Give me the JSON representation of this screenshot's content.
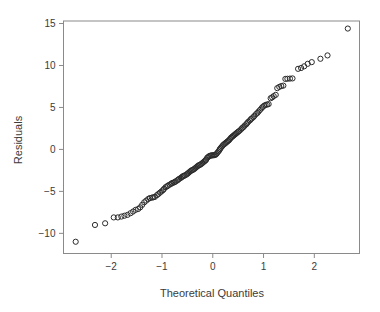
{
  "chart_data": {
    "type": "scatter",
    "title": "",
    "xlabel": "Theoretical Quantiles",
    "ylabel": "Residuals",
    "xlim": [
      -2.94,
      2.89
    ],
    "ylim": [
      -12.4,
      15.3
    ],
    "xticks": [
      -2,
      -1,
      0,
      1,
      2
    ],
    "xtick_labels": [
      "−2",
      "−1",
      "0",
      "1",
      "2"
    ],
    "yticks": [
      -10,
      -5,
      0,
      5,
      10,
      15
    ],
    "ytick_labels": [
      "−10",
      "−5",
      "0",
      "5",
      "10",
      "15"
    ],
    "grid": false,
    "legend": null,
    "marker": "open-circle",
    "marker_color": "#2b2b2b",
    "marker_radius": 2.6,
    "box_color": "#8a8a8a",
    "points": [
      [
        -2.7,
        -11.0
      ],
      [
        -2.32,
        -9.0
      ],
      [
        -2.12,
        -8.8
      ],
      [
        -1.95,
        -8.1
      ],
      [
        -1.87,
        -8.1
      ],
      [
        -1.8,
        -8.0
      ],
      [
        -1.74,
        -7.9
      ],
      [
        -1.68,
        -7.8
      ],
      [
        -1.62,
        -7.6
      ],
      [
        -1.57,
        -7.4
      ],
      [
        -1.52,
        -7.2
      ],
      [
        -1.47,
        -7.1
      ],
      [
        -1.43,
        -6.9
      ],
      [
        -1.39,
        -6.6
      ],
      [
        -1.35,
        -6.3
      ],
      [
        -1.31,
        -6.1
      ],
      [
        -1.27,
        -5.9
      ],
      [
        -1.24,
        -5.8
      ],
      [
        -1.2,
        -5.75
      ],
      [
        -1.17,
        -5.7
      ],
      [
        -1.14,
        -5.65
      ],
      [
        -1.1,
        -5.45
      ],
      [
        -1.07,
        -5.3
      ],
      [
        -1.04,
        -5.15
      ],
      [
        -1.01,
        -5.0
      ],
      [
        -0.98,
        -4.85
      ],
      [
        -0.96,
        -4.7
      ],
      [
        -0.93,
        -4.5
      ],
      [
        -0.9,
        -4.4
      ],
      [
        -0.88,
        -4.3
      ],
      [
        -0.85,
        -4.2
      ],
      [
        -0.82,
        -4.1
      ],
      [
        -0.8,
        -4.0
      ],
      [
        -0.77,
        -3.95
      ],
      [
        -0.75,
        -3.9
      ],
      [
        -0.73,
        -3.8
      ],
      [
        -0.7,
        -3.7
      ],
      [
        -0.68,
        -3.6
      ],
      [
        -0.66,
        -3.5
      ],
      [
        -0.63,
        -3.4
      ],
      [
        -0.61,
        -3.3
      ],
      [
        -0.59,
        -3.2
      ],
      [
        -0.57,
        -3.15
      ],
      [
        -0.55,
        -3.1
      ],
      [
        -0.52,
        -3.0
      ],
      [
        -0.5,
        -2.9
      ],
      [
        -0.48,
        -2.8
      ],
      [
        -0.46,
        -2.7
      ],
      [
        -0.44,
        -2.6
      ],
      [
        -0.42,
        -2.5
      ],
      [
        -0.4,
        -2.45
      ],
      [
        -0.38,
        -2.4
      ],
      [
        -0.36,
        -2.3
      ],
      [
        -0.34,
        -2.2
      ],
      [
        -0.32,
        -2.1
      ],
      [
        -0.3,
        -2.0
      ],
      [
        -0.28,
        -1.9
      ],
      [
        -0.26,
        -1.85
      ],
      [
        -0.24,
        -1.8
      ],
      [
        -0.22,
        -1.7
      ],
      [
        -0.2,
        -1.6
      ],
      [
        -0.18,
        -1.5
      ],
      [
        -0.16,
        -1.4
      ],
      [
        -0.14,
        -1.3
      ],
      [
        -0.13,
        -1.2
      ],
      [
        -0.11,
        -1.0
      ],
      [
        -0.09,
        -0.9
      ],
      [
        -0.07,
        -0.8
      ],
      [
        -0.05,
        -0.75
      ],
      [
        -0.03,
        -0.72
      ],
      [
        -0.01,
        -0.7
      ],
      [
        0.01,
        -0.7
      ],
      [
        0.03,
        -0.68
      ],
      [
        0.05,
        -0.65
      ],
      [
        0.07,
        -0.55
      ],
      [
        0.09,
        -0.4
      ],
      [
        0.11,
        -0.25
      ],
      [
        0.13,
        -0.1
      ],
      [
        0.14,
        0.05
      ],
      [
        0.16,
        0.2
      ],
      [
        0.18,
        0.35
      ],
      [
        0.2,
        0.5
      ],
      [
        0.22,
        0.6
      ],
      [
        0.24,
        0.7
      ],
      [
        0.26,
        0.8
      ],
      [
        0.28,
        0.9
      ],
      [
        0.3,
        1.0
      ],
      [
        0.32,
        1.1
      ],
      [
        0.34,
        1.25
      ],
      [
        0.36,
        1.4
      ],
      [
        0.38,
        1.5
      ],
      [
        0.4,
        1.6
      ],
      [
        0.42,
        1.7
      ],
      [
        0.44,
        1.8
      ],
      [
        0.46,
        1.9
      ],
      [
        0.48,
        2.0
      ],
      [
        0.5,
        2.1
      ],
      [
        0.52,
        2.2
      ],
      [
        0.55,
        2.35
      ],
      [
        0.57,
        2.5
      ],
      [
        0.59,
        2.6
      ],
      [
        0.61,
        2.7
      ],
      [
        0.63,
        2.85
      ],
      [
        0.66,
        3.0
      ],
      [
        0.68,
        3.15
      ],
      [
        0.7,
        3.3
      ],
      [
        0.73,
        3.45
      ],
      [
        0.75,
        3.6
      ],
      [
        0.77,
        3.7
      ],
      [
        0.8,
        3.85
      ],
      [
        0.82,
        4.0
      ],
      [
        0.85,
        4.2
      ],
      [
        0.88,
        4.35
      ],
      [
        0.9,
        4.5
      ],
      [
        0.93,
        4.7
      ],
      [
        0.96,
        4.9
      ],
      [
        0.98,
        5.05
      ],
      [
        1.01,
        5.2
      ],
      [
        1.04,
        5.3
      ],
      [
        1.07,
        5.35
      ],
      [
        1.1,
        5.4
      ],
      [
        1.14,
        6.1
      ],
      [
        1.17,
        6.2
      ],
      [
        1.2,
        6.35
      ],
      [
        1.24,
        6.5
      ],
      [
        1.27,
        7.3
      ],
      [
        1.31,
        7.45
      ],
      [
        1.35,
        7.55
      ],
      [
        1.39,
        7.6
      ],
      [
        1.43,
        8.4
      ],
      [
        1.47,
        8.42
      ],
      [
        1.52,
        8.44
      ],
      [
        1.57,
        8.46
      ],
      [
        1.68,
        9.6
      ],
      [
        1.74,
        9.7
      ],
      [
        1.8,
        9.9
      ],
      [
        1.87,
        10.2
      ],
      [
        1.95,
        10.4
      ],
      [
        2.12,
        10.8
      ],
      [
        2.26,
        11.2
      ],
      [
        2.66,
        14.4
      ]
    ]
  }
}
